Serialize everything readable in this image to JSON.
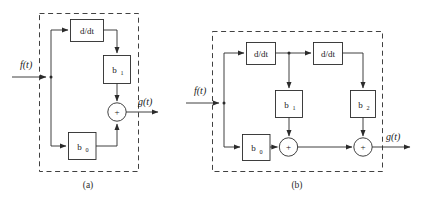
{
  "figure": {
    "title_absent": true,
    "background_color": "#ffffff",
    "line_color": "#2b2b2b",
    "panels": [
      {
        "caption": "(a)",
        "input_label": "f(t)",
        "output_label": "g(t)",
        "blocks": [
          {
            "id": "ddt-a",
            "label": "d/dt",
            "kind": "derivative"
          },
          {
            "id": "b1-a",
            "label": "b",
            "sub": "1",
            "kind": "gain"
          },
          {
            "id": "b0-a",
            "label": "b",
            "sub": "0",
            "kind": "gain"
          }
        ],
        "summers": [
          {
            "id": "sum-a",
            "label": "+",
            "kind": "adder"
          }
        ]
      },
      {
        "caption": "(b)",
        "input_label": "f(t)",
        "output_label": "g(t)",
        "blocks": [
          {
            "id": "ddt-b1",
            "label": "d/dt",
            "kind": "derivative"
          },
          {
            "id": "ddt-b2",
            "label": "d/dt",
            "kind": "derivative"
          },
          {
            "id": "b1-b",
            "label": "b",
            "sub": "1",
            "kind": "gain"
          },
          {
            "id": "b2-b",
            "label": "b",
            "sub": "2",
            "kind": "gain"
          },
          {
            "id": "b0-b",
            "label": "b",
            "sub": "0",
            "kind": "gain"
          }
        ],
        "summers": [
          {
            "id": "sum-b1",
            "label": "+",
            "kind": "adder"
          },
          {
            "id": "sum-b2",
            "label": "+",
            "kind": "adder"
          }
        ]
      }
    ]
  }
}
